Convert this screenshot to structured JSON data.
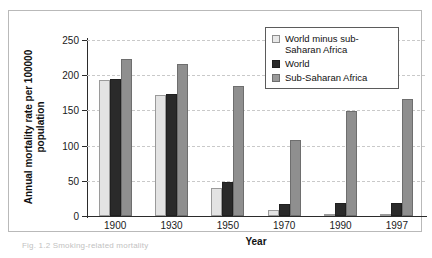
{
  "figure": {
    "caption": "Fig. 1.2 Smoking-related mortality"
  },
  "legend": {
    "position": "top-right",
    "items": [
      {
        "label": "World minus sub-Saharan Africa",
        "color": "#e3e3e3",
        "swatch_name": "legend-swatch-world-minus-ssa"
      },
      {
        "label": "World",
        "color": "#2a2a2a",
        "swatch_name": "legend-swatch-world"
      },
      {
        "label": "Sub-Saharan Africa",
        "color": "#8f8f8f",
        "swatch_name": "legend-swatch-ssa"
      }
    ]
  },
  "chart_data": {
    "type": "bar",
    "title": "",
    "xlabel": "Year",
    "ylabel": "Annual mortality rate per 100000 population",
    "categories": [
      "1900",
      "1930",
      "1950",
      "1970",
      "1990",
      "1997"
    ],
    "series": [
      {
        "name": "World minus sub-Saharan Africa",
        "color": "#e3e3e3",
        "values": [
          193,
          172,
          40,
          8,
          2,
          1
        ]
      },
      {
        "name": "World",
        "color": "#2a2a2a",
        "values": [
          194,
          174,
          48,
          17,
          18,
          19
        ]
      },
      {
        "name": "Sub-Saharan Africa",
        "color": "#8f8f8f",
        "values": [
          223,
          216,
          185,
          108,
          149,
          166
        ]
      }
    ],
    "ylim": [
      0,
      250
    ],
    "yticks": [
      0,
      50,
      100,
      150,
      200,
      250
    ],
    "ytick_labels": [
      "0",
      "50",
      "100",
      "150",
      "200",
      "250"
    ],
    "grid": true,
    "grid_axis": "y",
    "grid_style": "dashed",
    "grid_color": "#c9c9c9",
    "legend_position": "upper right"
  }
}
